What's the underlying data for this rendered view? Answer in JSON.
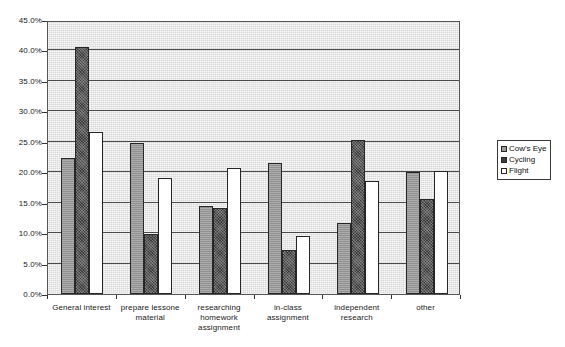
{
  "chart_data": {
    "type": "bar",
    "title": "",
    "xlabel": "",
    "ylabel": "",
    "ylim": [
      0,
      45
    ],
    "ytick_step": 5,
    "grid": true,
    "legend_position": "right",
    "ytick_labels": [
      "45.0%",
      "40.0%",
      "35.0%",
      "30.0%",
      "25.0%",
      "20.0%",
      "15.0%",
      "10.0%",
      "5.0%",
      "0.0%"
    ],
    "ytick_values": [
      45,
      40,
      35,
      30,
      25,
      20,
      15,
      10,
      5,
      0
    ],
    "categories": [
      "General interest",
      "prepare lessone material",
      "researching homework assignment",
      "in-class assignment",
      "independent research",
      "other"
    ],
    "series": [
      {
        "name": "Cow's Eye",
        "color": "#9a9a9a",
        "values": [
          22.3,
          24.8,
          14.5,
          21.5,
          11.7,
          20.0
        ]
      },
      {
        "name": "Cycling",
        "color": "#3b3b3b",
        "values": [
          40.5,
          9.8,
          14.2,
          7.3,
          25.3,
          15.6
        ]
      },
      {
        "name": "Flight",
        "color": "#ffffff",
        "values": [
          26.6,
          19.0,
          20.7,
          9.5,
          18.5,
          20.2
        ]
      }
    ]
  },
  "legend": {
    "items": [
      {
        "label": "Cow's Eye"
      },
      {
        "label": "Cycling"
      },
      {
        "label": "Flight"
      }
    ]
  },
  "axis": {
    "plot_background": "#d8d8d8",
    "gridline_color": "#4a4a4a"
  }
}
